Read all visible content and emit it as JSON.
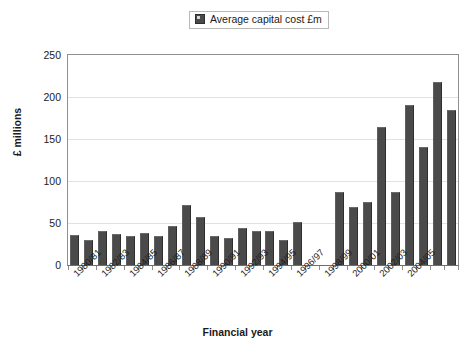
{
  "legend": {
    "entries": [
      {
        "label": "Average capital cost £m",
        "color": "#4a4a4a",
        "swatch_icon": "square-swatch-icon"
      }
    ],
    "position": "top-center"
  },
  "axes": {
    "y_title": "£ millions",
    "x_title": "Financial year",
    "y_ticks": [
      "0",
      "50",
      "100",
      "150",
      "200",
      "250"
    ]
  },
  "chart_data": {
    "type": "bar",
    "title": "",
    "subtitle": "",
    "xlabel": "Financial year",
    "ylabel": "£ millions",
    "ylim": [
      0,
      250
    ],
    "ytick_step": 50,
    "grid": true,
    "legend_position": "top-center",
    "series": [
      {
        "name": "Average capital cost £m",
        "color": "#4a4a4a",
        "values": [
          36,
          30,
          41,
          37,
          35,
          38,
          34,
          47,
          72,
          57,
          34,
          32,
          44,
          41,
          41,
          30,
          51,
          null,
          null,
          87,
          69,
          75,
          164,
          87,
          190,
          140,
          218,
          185
        ]
      }
    ],
    "categories": [
      "1980/81",
      "1981/82",
      "1982/83",
      "1983/84",
      "1984/85",
      "1985/86",
      "1986/87",
      "1987/88",
      "1988/89",
      "1989/90",
      "1990/91",
      "1991/92",
      "1992/93",
      "1993/94",
      "1994/95",
      "1995/96",
      "1996/97",
      "1997/98",
      "1998/99",
      "1999/00",
      "2000/01",
      "2001/02",
      "2002/03",
      "2003/04",
      "2004/05",
      "2005/06",
      "2006/07",
      "2007/08"
    ],
    "tick_labels_shown": [
      "1980/81",
      "1982/83",
      "1984/85",
      "1986/87",
      "1988/89",
      "1990/91",
      "1992/93",
      "1994/95",
      "1996/97",
      "1998/99",
      "2000/01",
      "2002/03",
      "2004/05"
    ]
  }
}
